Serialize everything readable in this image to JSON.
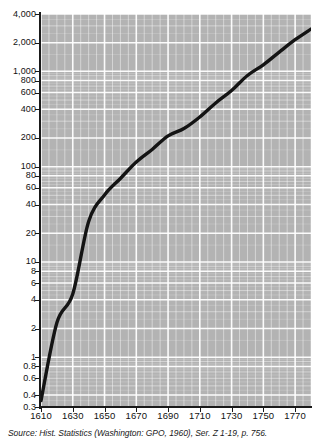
{
  "figure": {
    "source_note": "Source: Hist. Statistics (Washington: GPO, 1960), Ser. Z 1-19, p. 756.",
    "plot_bg_color": "#b3b3b3",
    "gridline_color": "#ffffff",
    "line_color": "#141414",
    "axis_color": "#1a1a1a"
  },
  "chart_data": {
    "type": "line",
    "title": "",
    "subtitle": "",
    "xlabel": "",
    "ylabel": "",
    "yscale": "log",
    "xscale": "linear",
    "ylim": [
      0.3,
      4000
    ],
    "xlim": [
      1610,
      1780
    ],
    "grid": true,
    "legend": "none",
    "annotations": [],
    "y_tick_labels": [
      "4,000",
      "2,000",
      "1,000",
      "800",
      "600",
      "400",
      "200",
      "100",
      "80",
      "60",
      "40",
      "20",
      "10",
      "8",
      "6",
      "4",
      "2",
      "1",
      "0.8",
      "0.6",
      "0.4",
      "0.3"
    ],
    "y_tick_values": [
      4000,
      2000,
      1000,
      800,
      600,
      400,
      200,
      100,
      80,
      60,
      40,
      20,
      10,
      8,
      6,
      4,
      2,
      1,
      0.8,
      0.6,
      0.4,
      0.3
    ],
    "x_tick_labels": [
      "1610",
      "1630",
      "1650",
      "1670",
      "1690",
      "1710",
      "1730",
      "1750",
      "1770"
    ],
    "x_tick_values": [
      1610,
      1630,
      1650,
      1670,
      1690,
      1710,
      1730,
      1750,
      1770
    ],
    "series": [
      {
        "name": "Colonial population (thousands)",
        "x": [
          1610,
          1620,
          1630,
          1640,
          1650,
          1660,
          1670,
          1680,
          1690,
          1700,
          1710,
          1720,
          1730,
          1740,
          1750,
          1760,
          1770,
          1780
        ],
        "values": [
          0.35,
          2.3,
          4.6,
          26.6,
          50.4,
          75.1,
          111.9,
          151.5,
          210.4,
          250.9,
          331.7,
          466.2,
          629.4,
          905.6,
          1170.8,
          1593.6,
          2148.1,
          2780.4
        ]
      }
    ]
  }
}
